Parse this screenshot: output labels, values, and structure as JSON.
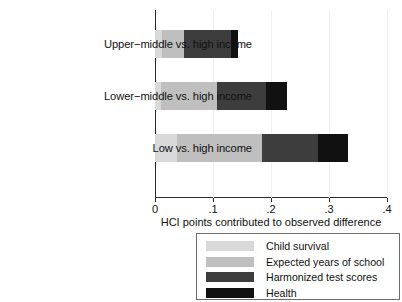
{
  "chart_data": {
    "type": "bar",
    "orientation": "horizontal",
    "stacked": true,
    "title": "",
    "xlabel": "HCI points contributed to observed difference",
    "ylabel": "",
    "xlim": [
      0,
      0.4
    ],
    "xticks": [
      "0",
      ".1",
      ".2",
      ".3",
      ".4"
    ],
    "xtick_values": [
      0,
      0.1,
      0.2,
      0.3,
      0.4
    ],
    "grid": false,
    "legend_position": "below-right",
    "categories": [
      "Upper−middle vs. high income",
      "Lower−middle vs. high income",
      "Low vs. high income"
    ],
    "series": [
      {
        "name": "Child survival",
        "color": "#d9d9d9",
        "values": [
          0.012,
          0.01,
          0.038
        ]
      },
      {
        "name": "Expected years of school",
        "color": "#bfbfbf",
        "values": [
          0.038,
          0.097,
          0.146
        ]
      },
      {
        "name": "Harmonized test scores",
        "color": "#3d3d3d",
        "values": [
          0.081,
          0.084,
          0.097
        ]
      },
      {
        "name": "Health",
        "color": "#111111",
        "values": [
          0.012,
          0.036,
          0.052
        ]
      }
    ],
    "totals": [
      0.143,
      0.227,
      0.333
    ]
  },
  "legend": {
    "entries": [
      {
        "label": "Child survival"
      },
      {
        "label": "Expected years of school"
      },
      {
        "label": "Harmonized test scores"
      },
      {
        "label": "Health"
      }
    ]
  }
}
